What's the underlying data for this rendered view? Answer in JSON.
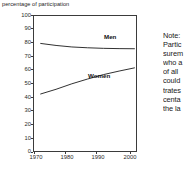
{
  "chart_data": {
    "type": "line",
    "title": "",
    "ylabel": "percentage of participation",
    "xlabel": "",
    "x": [
      1970,
      1975,
      1980,
      1985,
      1990,
      1995,
      2000
    ],
    "xlim": [
      1968,
      2001
    ],
    "ylim": [
      0,
      100
    ],
    "ytick_labels": [
      "100",
      "90",
      "80",
      "70",
      "60",
      "50",
      "40",
      "30",
      "20",
      "10",
      "0"
    ],
    "ytick_values": [
      100,
      90,
      80,
      70,
      60,
      50,
      40,
      30,
      20,
      10,
      0
    ],
    "xtick_labels": [
      "1970",
      "1980",
      "1990",
      "2000"
    ],
    "xtick_values": [
      1970,
      1980,
      1990,
      2000
    ],
    "grid": false,
    "legend_position": "inline-annotation",
    "series": [
      {
        "name": "Men",
        "label": "Men",
        "values": [
          80,
          78.5,
          77.4,
          76.8,
          76.4,
          76.2,
          76.1
        ]
      },
      {
        "name": "Women",
        "label": "Women",
        "values": [
          43,
          46.5,
          50.5,
          54.0,
          57.2,
          59.8,
          62.2
        ]
      }
    ],
    "annotations": [
      {
        "text": "Men",
        "x": 1994,
        "y": 80
      },
      {
        "text": "Women",
        "x": 1989,
        "y": 52
      }
    ]
  },
  "axis_title": "percentage of participation",
  "yticks": [
    {
      "label": "100",
      "value": 100
    },
    {
      "label": "90",
      "value": 90
    },
    {
      "label": "80",
      "value": 80
    },
    {
      "label": "70",
      "value": 70
    },
    {
      "label": "60",
      "value": 60
    },
    {
      "label": "50",
      "value": 50
    },
    {
      "label": "40",
      "value": 40
    },
    {
      "label": "30",
      "value": 30
    },
    {
      "label": "20",
      "value": 20
    },
    {
      "label": "10",
      "value": 10
    },
    {
      "label": "0",
      "value": 0
    }
  ],
  "xticks": [
    {
      "label": "1970",
      "value": 1970
    },
    {
      "label": "1980",
      "value": 1980
    },
    {
      "label": "1990",
      "value": 1990
    },
    {
      "label": "2000",
      "value": 2000
    }
  ],
  "series_labels": {
    "men": "Men",
    "women": "Women"
  },
  "note": {
    "lines": [
      "Note:",
      "Partic",
      "surem",
      "who a",
      "of all",
      "could",
      "trates",
      "centa",
      "the la"
    ]
  },
  "colors": {
    "line": "#1a1a1a",
    "axis": "#3b3b3b",
    "text": "#1a1a1a",
    "background": "#ffffff"
  }
}
